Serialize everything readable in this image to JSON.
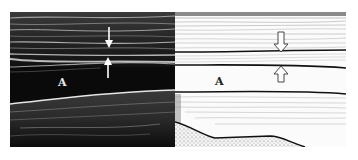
{
  "figure": {
    "panels": [
      {
        "id": "ultrasound",
        "description": "Longitudinal ultrasound image",
        "label": "A",
        "arrows": [
          "down-arrow",
          "up-arrow"
        ],
        "colors": {
          "background": "#0a0a0a",
          "echo": "#d8d8d8",
          "arrow": "#ffffff"
        }
      },
      {
        "id": "schematic",
        "description": "Corresponding line drawing",
        "label": "A",
        "arrows": [
          "down-arrow-outline",
          "up-arrow-outline"
        ],
        "colors": {
          "background": "#fbfbfb",
          "line": "#111111",
          "hatch": "#9a9a9a"
        }
      }
    ]
  }
}
